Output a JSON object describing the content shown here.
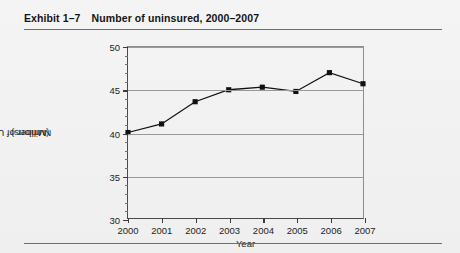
{
  "exhibit": {
    "number": "Exhibit 1–7",
    "title": "Number of uninsured, 2000–2007"
  },
  "colors": {
    "background": "#f2f2f2",
    "line": "#111111",
    "marker": "#111111",
    "gridline": "#9a9a9a",
    "axis": "#3c3c3c",
    "rule": "#6d6d6d"
  },
  "chart_data": {
    "type": "line",
    "title": "Number of uninsured, 2000–2007",
    "xlabel": "Year",
    "ylabel": "Number of Uninsured\n(Millions)",
    "ylabel_line1": "Number of Uninsured",
    "ylabel_line2": "(Millions)",
    "categories": [
      "2000",
      "2001",
      "2002",
      "2003",
      "2004",
      "2005",
      "2006",
      "2007"
    ],
    "x": [
      2000,
      2001,
      2002,
      2003,
      2004,
      2005,
      2006,
      2007
    ],
    "values": [
      40.0,
      41.0,
      43.6,
      45.0,
      45.3,
      44.8,
      47.0,
      45.7
    ],
    "series": [
      {
        "name": "Number of Uninsured (Millions)",
        "values": [
          40.0,
          41.0,
          43.6,
          45.0,
          45.3,
          44.8,
          47.0,
          45.7
        ]
      }
    ],
    "ylim": [
      30,
      50
    ],
    "xlim": [
      2000,
      2007
    ],
    "ytick_labels": [
      "30",
      "35",
      "40",
      "45",
      "50"
    ],
    "yticks": [
      30,
      35,
      40,
      45,
      50
    ],
    "yminor_step": 1,
    "xtick_labels": [
      "2000",
      "2001",
      "2002",
      "2003",
      "2004",
      "2005",
      "2006",
      "2007"
    ],
    "grid": "horizontal",
    "legend": "none",
    "marker": "square"
  }
}
